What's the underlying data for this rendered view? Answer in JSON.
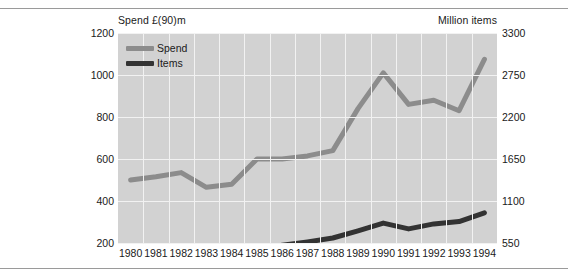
{
  "figure": {
    "left_axis_title": "Spend £(90)m",
    "right_axis_title": "Million items"
  },
  "legend": {
    "items": [
      {
        "label": "Spend",
        "color": "#8c8c8c"
      },
      {
        "label": "Items",
        "color": "#333333"
      }
    ]
  },
  "chart_data": {
    "type": "line",
    "title": "",
    "xlabel": "",
    "ylabel": "Spend £(90)m",
    "y2label": "Million items",
    "grid": true,
    "legend_position": "top-left-inside",
    "plot_background": "#d2d2d2",
    "x": [
      "1980",
      "1981",
      "1982",
      "1983",
      "1984",
      "1985",
      "1986",
      "1987",
      "1988",
      "1989",
      "1990",
      "1991",
      "1992",
      "1993",
      "1994"
    ],
    "ylim": [
      200,
      1200
    ],
    "yticks": [
      200,
      400,
      600,
      800,
      1000,
      1200
    ],
    "y2lim": [
      550,
      3300
    ],
    "y2ticks": [
      550,
      1100,
      1650,
      2200,
      2750,
      3300
    ],
    "series": [
      {
        "name": "Spend",
        "color": "#8c8c8c",
        "axis": "left",
        "units": "£(90)m",
        "values": [
          500,
          515,
          535,
          465,
          480,
          600,
          600,
          615,
          640,
          840,
          1010,
          860,
          880,
          830,
          1075
        ]
      },
      {
        "name": "Items",
        "color": "#333333",
        "axis": "right",
        "units": "Million items",
        "values": [
          310,
          350,
          390,
          375,
          425,
          480,
          520,
          565,
          615,
          710,
          810,
          735,
          800,
          830,
          945
        ]
      }
    ]
  }
}
